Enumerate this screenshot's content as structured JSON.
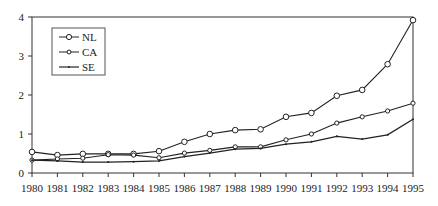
{
  "chart_data": {
    "type": "line",
    "title": "",
    "xlabel": "",
    "ylabel": "",
    "x": [
      1980,
      1981,
      1982,
      1983,
      1984,
      1985,
      1986,
      1987,
      1988,
      1989,
      1990,
      1991,
      1992,
      1993,
      1994,
      1995
    ],
    "x_tick_labels": [
      "1980",
      "1981",
      "1982",
      "1983",
      "1984",
      "1985",
      "1986",
      "1987",
      "1988",
      "1989",
      "1990",
      "1991",
      "1992",
      "1993",
      "1994",
      "1995"
    ],
    "y_ticks": [
      0,
      1,
      2,
      3,
      4
    ],
    "y_tick_labels": [
      "0",
      "1",
      "2",
      "3",
      "4"
    ],
    "ylim": [
      0,
      4
    ],
    "grid": false,
    "legend_position": "upper-left-inside",
    "series": [
      {
        "name": "NL",
        "marker": "circle-large",
        "values": [
          0.54,
          0.46,
          0.49,
          0.49,
          0.49,
          0.56,
          0.8,
          1.0,
          1.1,
          1.12,
          1.44,
          1.54,
          1.98,
          2.13,
          2.79,
          3.92
        ]
      },
      {
        "name": "CA",
        "marker": "circle-small",
        "values": [
          0.33,
          0.36,
          0.38,
          0.47,
          0.46,
          0.39,
          0.51,
          0.58,
          0.67,
          0.67,
          0.85,
          1.0,
          1.28,
          1.44,
          1.59,
          1.79
        ]
      },
      {
        "name": "SE",
        "marker": "dot",
        "values": [
          0.33,
          0.31,
          0.28,
          0.28,
          0.29,
          0.31,
          0.42,
          0.51,
          0.61,
          0.63,
          0.74,
          0.8,
          0.94,
          0.87,
          0.98,
          1.38
        ]
      }
    ]
  },
  "legend": {
    "items": [
      {
        "label": "NL"
      },
      {
        "label": "CA"
      },
      {
        "label": "SE"
      }
    ]
  },
  "colors": {
    "line": "#222222",
    "axis": "#333333",
    "background": "#ffffff"
  }
}
